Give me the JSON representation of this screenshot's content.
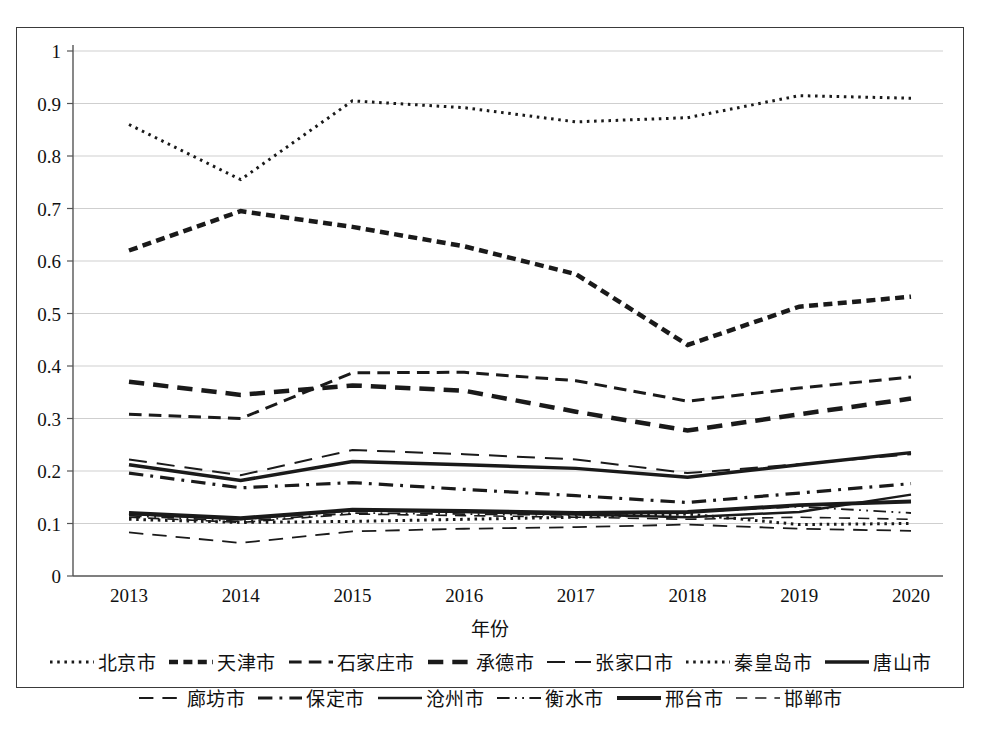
{
  "chart_data": {
    "type": "line",
    "title": "",
    "xlabel": "年份",
    "ylabel": "",
    "x": [
      2013,
      2014,
      2015,
      2016,
      2017,
      2018,
      2019,
      2020
    ],
    "xtick_labels": [
      "2013",
      "2014",
      "2015",
      "2016",
      "2017",
      "2018",
      "2019",
      "2020"
    ],
    "ytick_labels": [
      "1",
      "0.9",
      "0.8",
      "0.7",
      "0.6",
      "0.5",
      "0.4",
      "0.3",
      "0.2",
      "0.1",
      "0"
    ],
    "ylim": [
      0,
      1
    ],
    "ystep": 0.1,
    "grid": true,
    "legend_position": "bottom",
    "series": [
      {
        "name": "北京市",
        "dash": "dotted",
        "width": 3.0,
        "color": "#1a1a1a",
        "values": [
          0.86,
          0.755,
          0.905,
          0.892,
          0.865,
          0.873,
          0.915,
          0.91
        ]
      },
      {
        "name": "天津市",
        "dash": "dashed-short",
        "width": 4.5,
        "color": "#1a1a1a",
        "values": [
          0.62,
          0.695,
          0.665,
          0.628,
          0.575,
          0.44,
          0.513,
          0.532
        ]
      },
      {
        "name": "石家庄市",
        "dash": "dashed-med",
        "width": 3.0,
        "color": "#1a1a1a",
        "values": [
          0.308,
          0.3,
          0.387,
          0.388,
          0.372,
          0.333,
          0.358,
          0.379
        ]
      },
      {
        "name": "承德市",
        "dash": "dashed-long",
        "width": 4.5,
        "color": "#1a1a1a",
        "values": [
          0.37,
          0.345,
          0.363,
          0.353,
          0.313,
          0.277,
          0.308,
          0.338
        ]
      },
      {
        "name": "张家口市",
        "dash": "dashed-wide",
        "width": 2.0,
        "color": "#1a1a1a",
        "values": [
          0.222,
          0.192,
          0.24,
          0.232,
          0.222,
          0.196,
          0.213,
          0.232
        ]
      },
      {
        "name": "秦皇岛市",
        "dash": "dotted",
        "width": 3.0,
        "color": "#1a1a1a",
        "values": [
          0.108,
          0.102,
          0.104,
          0.108,
          0.112,
          0.118,
          0.098,
          0.1
        ]
      },
      {
        "name": "唐山市",
        "dash": "solid",
        "width": 3.5,
        "color": "#1a1a1a",
        "values": [
          0.212,
          0.182,
          0.218,
          0.212,
          0.205,
          0.188,
          0.212,
          0.235
        ]
      },
      {
        "name": "廊坊市",
        "dash": "dashed-fine",
        "width": 1.8,
        "color": "#1a1a1a",
        "values": [
          0.083,
          0.063,
          0.085,
          0.09,
          0.093,
          0.098,
          0.09,
          0.086
        ]
      },
      {
        "name": "保定市",
        "dash": "dashdot",
        "width": 3.2,
        "color": "#1a1a1a",
        "values": [
          0.196,
          0.168,
          0.178,
          0.165,
          0.153,
          0.14,
          0.158,
          0.176
        ]
      },
      {
        "name": "沧州市",
        "dash": "solid",
        "width": 2.5,
        "color": "#1a1a1a",
        "values": [
          0.118,
          0.108,
          0.125,
          0.122,
          0.117,
          0.112,
          0.122,
          0.155
        ]
      },
      {
        "name": "衡水市",
        "dash": "dashdotdot",
        "width": 1.8,
        "color": "#1a1a1a",
        "values": [
          0.115,
          0.104,
          0.12,
          0.118,
          0.116,
          0.122,
          0.132,
          0.12
        ]
      },
      {
        "name": "邢台市",
        "dash": "solid-thick",
        "width": 4.0,
        "color": "#1a1a1a",
        "values": [
          0.12,
          0.11,
          0.126,
          0.124,
          0.12,
          0.122,
          0.135,
          0.142
        ]
      },
      {
        "name": "邯郸市",
        "dash": "dashed-thin",
        "width": 1.6,
        "color": "#1a1a1a",
        "values": [
          0.112,
          0.102,
          0.118,
          0.115,
          0.112,
          0.108,
          0.112,
          0.108
        ]
      }
    ]
  },
  "axis": {
    "x_title": "年份"
  },
  "legend": {
    "row1": [
      "北京市",
      "天津市",
      "石家庄市",
      "承德市",
      "张家口市",
      "秦皇岛市",
      "唐山市"
    ],
    "row2": [
      "廊坊市",
      "保定市",
      "沧州市",
      "衡水市",
      "邢台市",
      "邯郸市"
    ]
  },
  "caption": {
    "text": "图3-12 大气费环境критическ变化"
  }
}
